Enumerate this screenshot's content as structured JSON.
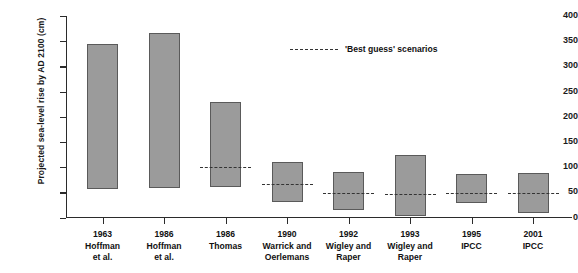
{
  "chart_data": {
    "type": "bar",
    "title": "",
    "xlabel": "",
    "ylabel": "Projected sea-level rise by AD 2100 (cm)",
    "ylim": [
      0,
      400
    ],
    "yticks": [
      0,
      50,
      100,
      150,
      200,
      250,
      300,
      350,
      400
    ],
    "grid": false,
    "legend_position": "top-center",
    "legend": [
      {
        "label": "'Best guess' scenarios",
        "style": "dashed-line"
      }
    ],
    "note": "Floating range bars: each bar spans a low to high projection; dashed line marks the 'best guess' value.",
    "categories": [
      "1963 Hoffman et al.",
      "1986 Hoffman et al.",
      "1986 Thomas",
      "1990 Warrick and Oerlemans",
      "1992 Wigley and Raper",
      "1993 Wigley and Raper",
      "1995 IPCC",
      "2001 IPCC"
    ],
    "series": [
      {
        "name": "low",
        "values": [
          56,
          58,
          60,
          31,
          15,
          3,
          28,
          9
        ]
      },
      {
        "name": "high",
        "values": [
          345,
          367,
          230,
          110,
          90,
          124,
          86,
          88
        ]
      },
      {
        "name": "best_guess",
        "values": [
          null,
          null,
          100,
          66,
          48,
          46,
          49,
          48
        ]
      }
    ],
    "points": [
      {
        "year": "1963",
        "source_line1": "Hoffman",
        "source_line2": "et al.",
        "low": 56,
        "high": 345,
        "best_guess": null
      },
      {
        "year": "1986",
        "source_line1": "Hoffman",
        "source_line2": "et al.",
        "low": 58,
        "high": 367,
        "best_guess": null
      },
      {
        "year": "1986",
        "source_line1": "Thomas",
        "source_line2": "",
        "low": 60,
        "high": 230,
        "best_guess": 100
      },
      {
        "year": "1990",
        "source_line1": "Warrick and",
        "source_line2": "Oerlemans",
        "low": 31,
        "high": 110,
        "best_guess": 66
      },
      {
        "year": "1992",
        "source_line1": "Wigley and",
        "source_line2": "Raper",
        "low": 15,
        "high": 90,
        "best_guess": 48
      },
      {
        "year": "1993",
        "source_line1": "Wigley and",
        "source_line2": "Raper",
        "low": 3,
        "high": 124,
        "best_guess": 46
      },
      {
        "year": "1995",
        "source_line1": "IPCC",
        "source_line2": "",
        "low": 28,
        "high": 86,
        "best_guess": 49
      },
      {
        "year": "2001",
        "source_line1": "IPCC",
        "source_line2": "",
        "low": 9,
        "high": 88,
        "best_guess": 48
      }
    ],
    "colors": {
      "bar_fill": "#9b9b9b",
      "bar_edge": "#5a5a5a",
      "axis": "#2b2b2b",
      "text": "#111111"
    }
  }
}
